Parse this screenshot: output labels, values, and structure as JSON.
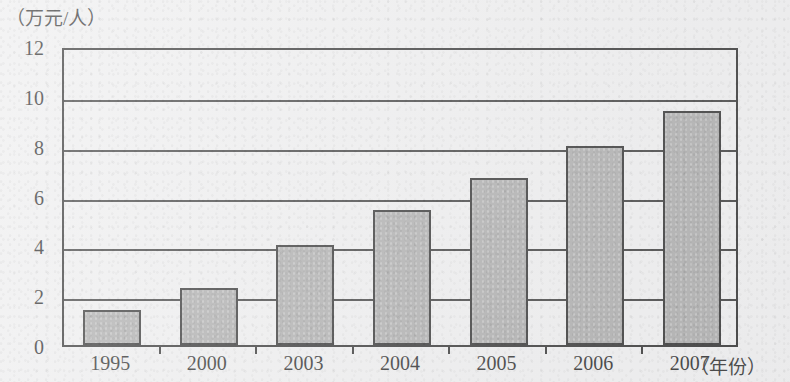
{
  "chart_data": {
    "type": "bar",
    "title": "",
    "subtitle": "",
    "xlabel": "（年份）",
    "ylabel": "（万元/人）",
    "categories": [
      "1995",
      "2000",
      "2003",
      "2004",
      "2005",
      "2006",
      "2007"
    ],
    "values": [
      1.4,
      2.3,
      4.0,
      5.4,
      6.7,
      8.0,
      9.4
    ],
    "ylim": [
      0,
      12
    ],
    "ytick_labels": [
      "0",
      "2",
      "4",
      "6",
      "8",
      "10",
      "12"
    ],
    "ytick_values": [
      0,
      2,
      4,
      6,
      8,
      10,
      12
    ],
    "grid": true,
    "grid_orientation": "horizontal",
    "legend": null,
    "legend_position": "none",
    "series": [
      {
        "name": "",
        "values": [
          1.4,
          2.3,
          4.0,
          5.4,
          6.7,
          8.0,
          9.4
        ]
      }
    ],
    "colors": {
      "bar_fill": "#a3a3a3",
      "bar_stroke": "#1d1d1d",
      "axis": "#1c1c1c",
      "grid": "#2a2a2a",
      "background": "#ececed",
      "text": "#131313"
    }
  }
}
